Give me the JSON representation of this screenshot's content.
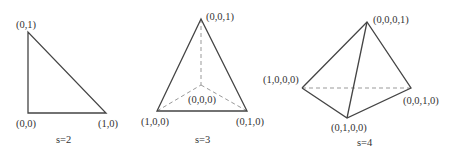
{
  "figures": [
    {
      "caption": "s=2",
      "vertices": [
        {
          "label": "(0,1)",
          "x": 28,
          "y": 32
        },
        {
          "label": "(0,0)",
          "x": 28,
          "y": 113
        },
        {
          "label": "(1,0)",
          "x": 106,
          "y": 113
        }
      ]
    },
    {
      "caption": "s=3",
      "vertices": [
        {
          "label": "(0,0,1)",
          "x": 201,
          "y": 19
        },
        {
          "label": "(1,0,0)",
          "x": 157,
          "y": 111
        },
        {
          "label": "(0,1,0)",
          "x": 247,
          "y": 111
        },
        {
          "label": "(0,0,0)",
          "x": 201,
          "y": 85
        }
      ]
    },
    {
      "caption": "s=4",
      "vertices": [
        {
          "label": "(0,0,0,1)",
          "x": 367,
          "y": 22
        },
        {
          "label": "(1,0,0,0)",
          "x": 302,
          "y": 88
        },
        {
          "label": "(0,0,1,0)",
          "x": 411,
          "y": 88
        },
        {
          "label": "(0,1,0,0)",
          "x": 347,
          "y": 118
        }
      ]
    }
  ],
  "colors": {
    "solid_edge": "#444444",
    "hidden_edge": "#999999",
    "text": "#333333"
  }
}
